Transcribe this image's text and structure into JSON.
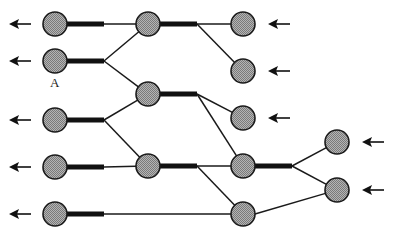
{
  "diagram": {
    "type": "tree-merge-network",
    "labels": [
      {
        "node": "c1n2",
        "text": "A"
      }
    ],
    "colors": {
      "node_fill": "#9a9a9a",
      "stroke": "#1a1a1a",
      "background": "#ffffff"
    },
    "columns": [
      {
        "id": "col1",
        "nodes": [
          "c1n1",
          "c1n2",
          "c1n3",
          "c1n4",
          "c1n5"
        ],
        "arrow_direction": "left"
      },
      {
        "id": "col2",
        "nodes": [
          "c2n1",
          "c2n2",
          "c2n3"
        ]
      },
      {
        "id": "col3",
        "nodes": [
          "c3n1",
          "c3n2",
          "c3n3",
          "c3n4",
          "c3n5"
        ],
        "arrow_direction": "left-incoming",
        "arrows_on": [
          "c3n1",
          "c3n2",
          "c3n3"
        ]
      },
      {
        "id": "col4",
        "nodes": [
          "c4n1",
          "c4n2"
        ],
        "arrow_direction": "left-incoming"
      }
    ],
    "edges": [
      {
        "from": "c1n1",
        "to": "c2n1"
      },
      {
        "from": "c1n2",
        "to": "c2n1"
      },
      {
        "from": "c1n2",
        "to": "c2n2"
      },
      {
        "from": "c1n3",
        "to": "c2n2"
      },
      {
        "from": "c1n3",
        "to": "c2n3"
      },
      {
        "from": "c1n4",
        "to": "c2n3"
      },
      {
        "from": "c1n5",
        "to": "c3n5"
      },
      {
        "from": "c2n1",
        "to": "c3n1"
      },
      {
        "from": "c2n1",
        "to": "c3n2"
      },
      {
        "from": "c2n2",
        "to": "c3n3"
      },
      {
        "from": "c2n2",
        "to": "c3n4"
      },
      {
        "from": "c2n3",
        "to": "c3n4"
      },
      {
        "from": "c2n3",
        "to": "c3n5"
      },
      {
        "from": "c3n4",
        "to": "c4n1"
      },
      {
        "from": "c3n4",
        "to": "c4n2"
      },
      {
        "from": "c3n5",
        "to": "c4n2"
      }
    ]
  }
}
